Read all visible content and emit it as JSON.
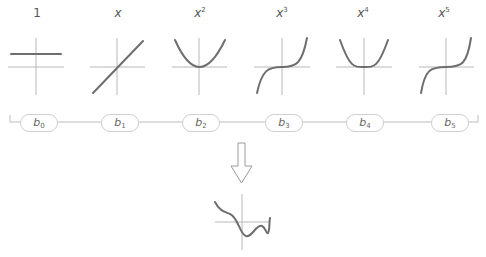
{
  "basis_labels": [
    {
      "base": "1",
      "exp": ""
    },
    {
      "base": "x",
      "exp": ""
    },
    {
      "base": "x",
      "exp": "2"
    },
    {
      "base": "x",
      "exp": "3"
    },
    {
      "base": "x",
      "exp": "4"
    },
    {
      "base": "x",
      "exp": "5"
    }
  ],
  "coefficients": [
    {
      "base": "b",
      "sub": "0"
    },
    {
      "base": "b",
      "sub": "1"
    },
    {
      "base": "b",
      "sub": "2"
    },
    {
      "base": "b",
      "sub": "3"
    },
    {
      "base": "b",
      "sub": "4"
    },
    {
      "base": "b",
      "sub": "5"
    }
  ],
  "colors": {
    "curve": "#6e6e6e",
    "axis": "#b5b5b5",
    "pill_border": "#cfcfcf",
    "text": "#555555"
  }
}
